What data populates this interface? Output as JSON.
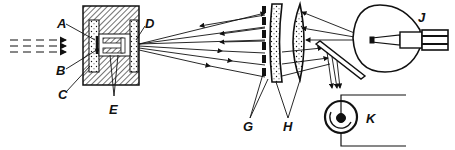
{
  "diagram": {
    "type": "optical-apparatus-schematic",
    "colors": {
      "ink": "#111111",
      "background": "#ffffff"
    },
    "labels": {
      "A": "A",
      "B": "B",
      "C": "C",
      "D": "D",
      "E": "E",
      "G": "G",
      "H": "H",
      "J": "J",
      "K": "K"
    },
    "components": [
      {
        "id": "incoming-light",
        "desc": "dashed arrows entering from left"
      },
      {
        "id": "housing",
        "desc": "hatched cylindrical block with inner chamber",
        "labels": [
          "A",
          "B",
          "C",
          "D",
          "E"
        ]
      },
      {
        "id": "ray-fan",
        "desc": "rays fanning between housing and grid"
      },
      {
        "id": "grid",
        "desc": "vertical column of slit elements",
        "label": "G"
      },
      {
        "id": "lenses",
        "desc": "two lens elements",
        "label": "H"
      },
      {
        "id": "lamp",
        "desc": "incandescent bulb",
        "label": "J"
      },
      {
        "id": "mirror",
        "desc": "tilted mirror reflecting rays downward"
      },
      {
        "id": "photocell",
        "desc": "circular photocell with wire leads",
        "label": "K"
      }
    ]
  }
}
